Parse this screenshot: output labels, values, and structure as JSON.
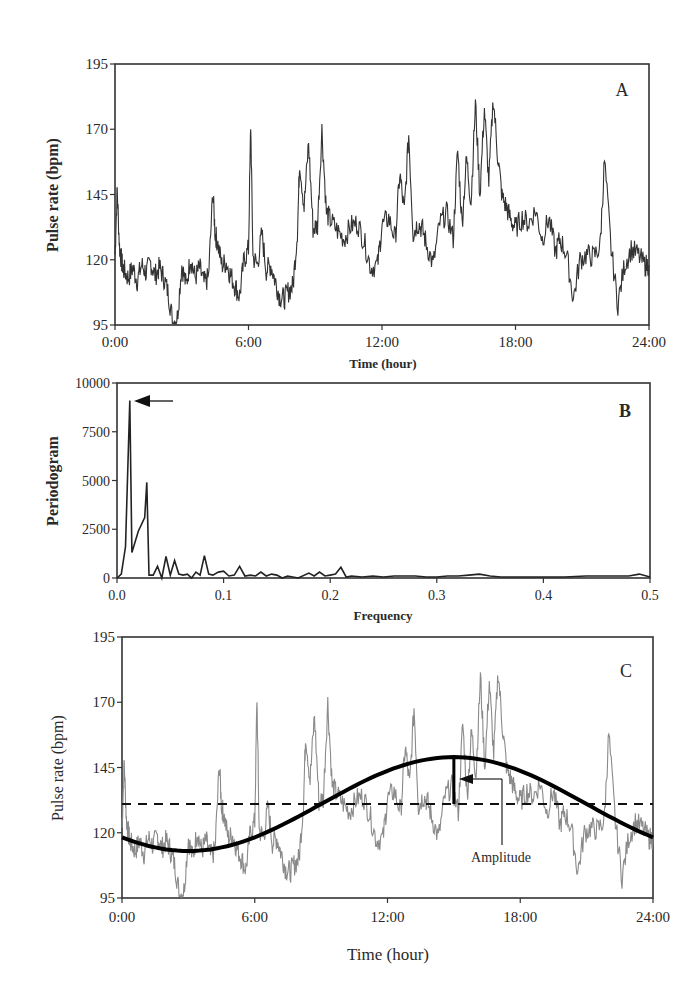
{
  "figure": {
    "panels": [
      {
        "id": "A",
        "label": "A",
        "type": "line",
        "ylabel": "Pulse rate (bpm)",
        "xlabel": "Time (hour)",
        "yticks": [
          95,
          120,
          145,
          170,
          195
        ],
        "xticks": [
          "0:00",
          "6:00",
          "12:00",
          "18:00",
          "24:00"
        ]
      },
      {
        "id": "B",
        "label": "B",
        "type": "line",
        "ylabel": "Periodogram",
        "xlabel": "Frequency",
        "yticks": [
          0,
          2500,
          5000,
          7500,
          10000
        ],
        "xticks": [
          "0.0",
          "0.1",
          "0.2",
          "0.3",
          "0.4",
          "0.5"
        ],
        "annotation": "arrow pointing to dominant peak"
      },
      {
        "id": "C",
        "label": "C",
        "type": "line",
        "ylabel": "Pulse rate (bpm)",
        "xlabel": "Time (hour)",
        "yticks": [
          95,
          120,
          145,
          170,
          195
        ],
        "xticks": [
          "0:00",
          "6:00",
          "12:00",
          "18:00",
          "24:00"
        ],
        "annotation": "Amplitude"
      }
    ]
  },
  "chart_data": [
    {
      "type": "line",
      "panel": "A",
      "title": "",
      "xlabel": "Time (hour)",
      "ylabel": "Pulse rate (bpm)",
      "xlim": [
        0,
        24
      ],
      "ylim": [
        95,
        195
      ],
      "grid": false,
      "x_tick_labels": [
        "0:00",
        "6:00",
        "12:00",
        "18:00",
        "24:00"
      ],
      "y_tick_labels": [
        "95",
        "120",
        "145",
        "170",
        "195"
      ],
      "series": [
        {
          "name": "Pulse rate",
          "color": "#333333",
          "x": [
            0.0,
            0.1,
            0.2,
            0.3,
            0.4,
            0.6,
            0.8,
            1.0,
            1.2,
            1.4,
            1.6,
            1.8,
            2.0,
            2.2,
            2.4,
            2.6,
            2.8,
            3.0,
            3.2,
            3.4,
            3.6,
            3.8,
            4.0,
            4.2,
            4.4,
            4.5,
            4.6,
            4.8,
            5.0,
            5.2,
            5.4,
            5.6,
            5.8,
            6.0,
            6.1,
            6.2,
            6.4,
            6.6,
            6.8,
            7.0,
            7.2,
            7.4,
            7.6,
            7.8,
            8.0,
            8.2,
            8.3,
            8.5,
            8.7,
            8.9,
            9.1,
            9.3,
            9.5,
            9.7,
            10.0,
            10.3,
            10.6,
            10.9,
            11.2,
            11.5,
            11.8,
            12.0,
            12.3,
            12.6,
            12.8,
            13.0,
            13.2,
            13.4,
            13.6,
            13.8,
            14.0,
            14.3,
            14.6,
            14.9,
            15.2,
            15.4,
            15.6,
            15.8,
            16.0,
            16.2,
            16.4,
            16.6,
            16.8,
            17.0,
            17.2,
            17.4,
            17.6,
            17.8,
            18.0,
            18.3,
            18.6,
            18.9,
            19.2,
            19.5,
            19.8,
            20.0,
            20.3,
            20.6,
            20.9,
            21.2,
            21.5,
            21.8,
            22.0,
            22.3,
            22.6,
            22.9,
            23.2,
            23.5,
            23.8,
            24.0
          ],
          "values": [
            122,
            147,
            125,
            119,
            116,
            113,
            117,
            112,
            118,
            115,
            119,
            114,
            117,
            113,
            107,
            96,
            98,
            118,
            110,
            121,
            113,
            117,
            111,
            113,
            146,
            130,
            127,
            118,
            119,
            114,
            110,
            106,
            120,
            124,
            172,
            121,
            118,
            130,
            116,
            118,
            112,
            106,
            105,
            108,
            110,
            131,
            158,
            140,
            165,
            132,
            133,
            170,
            138,
            135,
            131,
            128,
            133,
            134,
            127,
            117,
            118,
            133,
            136,
            128,
            153,
            138,
            168,
            130,
            134,
            132,
            126,
            118,
            134,
            138,
            128,
            162,
            134,
            159,
            142,
            180,
            145,
            178,
            150,
            182,
            160,
            144,
            140,
            135,
            132,
            136,
            134,
            139,
            128,
            136,
            123,
            128,
            122,
            105,
            120,
            122,
            121,
            125,
            158,
            124,
            103,
            118,
            124,
            122,
            118,
            118
          ]
        }
      ]
    },
    {
      "type": "line",
      "panel": "B",
      "title": "",
      "xlabel": "Frequency",
      "ylabel": "Periodogram",
      "xlim": [
        0,
        0.5
      ],
      "ylim": [
        0,
        10000
      ],
      "grid": false,
      "x_tick_labels": [
        "0.0",
        "0.1",
        "0.2",
        "0.3",
        "0.4",
        "0.5"
      ],
      "y_tick_labels": [
        "0",
        "2500",
        "5000",
        "7500",
        "10000"
      ],
      "series": [
        {
          "name": "Periodogram",
          "color": "#222222",
          "x": [
            0.0,
            0.004,
            0.008,
            0.012,
            0.014,
            0.02,
            0.026,
            0.028,
            0.03,
            0.034,
            0.038,
            0.042,
            0.046,
            0.05,
            0.054,
            0.058,
            0.062,
            0.066,
            0.07,
            0.074,
            0.078,
            0.082,
            0.086,
            0.09,
            0.095,
            0.1,
            0.105,
            0.11,
            0.115,
            0.12,
            0.125,
            0.13,
            0.135,
            0.14,
            0.145,
            0.15,
            0.155,
            0.16,
            0.17,
            0.18,
            0.185,
            0.19,
            0.195,
            0.2,
            0.205,
            0.21,
            0.215,
            0.22,
            0.23,
            0.24,
            0.25,
            0.26,
            0.27,
            0.28,
            0.29,
            0.3,
            0.31,
            0.32,
            0.33,
            0.34,
            0.35,
            0.36,
            0.38,
            0.4,
            0.42,
            0.44,
            0.46,
            0.48,
            0.49,
            0.5
          ],
          "values": [
            0,
            200,
            1600,
            9100,
            1300,
            2400,
            3100,
            4900,
            150,
            150,
            600,
            0,
            1100,
            150,
            900,
            200,
            150,
            200,
            0,
            300,
            150,
            1150,
            200,
            150,
            300,
            350,
            100,
            150,
            600,
            100,
            150,
            100,
            300,
            100,
            200,
            150,
            0,
            100,
            0,
            250,
            100,
            300,
            100,
            150,
            200,
            550,
            50,
            100,
            50,
            100,
            50,
            100,
            100,
            100,
            50,
            50,
            100,
            100,
            150,
            200,
            100,
            50,
            50,
            50,
            50,
            100,
            100,
            100,
            200,
            50
          ],
          "peak": {
            "frequency": 0.012,
            "value": 9100
          }
        }
      ]
    },
    {
      "type": "line",
      "panel": "C",
      "title": "",
      "xlabel": "Time (hour)",
      "ylabel": "Pulse rate (bpm)",
      "xlim": [
        0,
        24
      ],
      "ylim": [
        95,
        195
      ],
      "grid": false,
      "x_tick_labels": [
        "0:00",
        "6:00",
        "12:00",
        "18:00",
        "24:00"
      ],
      "y_tick_labels": [
        "95",
        "120",
        "145",
        "170",
        "195"
      ],
      "series": [
        {
          "name": "Pulse rate (raw)",
          "color": "#8a8a8a",
          "style": "thin solid",
          "source": "same as panel A"
        },
        {
          "name": "Cosinor fit",
          "color": "#000000",
          "style": "thick solid",
          "model": "mesor + amplitude*cos(2*pi*(t - acrophase)/24)",
          "mesor": 131,
          "amplitude": 18,
          "acrophase_hour": 15.0
        },
        {
          "name": "Mesor",
          "color": "#111111",
          "style": "dashed",
          "value": 131
        }
      ],
      "annotations": [
        {
          "text": "Amplitude",
          "x_hour": 15.0,
          "from": 131,
          "to": 149
        }
      ]
    }
  ]
}
